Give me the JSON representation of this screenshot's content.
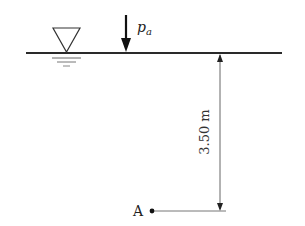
{
  "diagram": {
    "type": "hydrostatics",
    "free_surface_symbol": "inverted-triangle-water-level",
    "pressure_label": "p",
    "pressure_subscript": "a",
    "depth_label": "3.50 m",
    "point_label": "A",
    "colors": {
      "line": "#2a2a2a",
      "thin_line": "#555555",
      "background": "#ffffff"
    }
  }
}
